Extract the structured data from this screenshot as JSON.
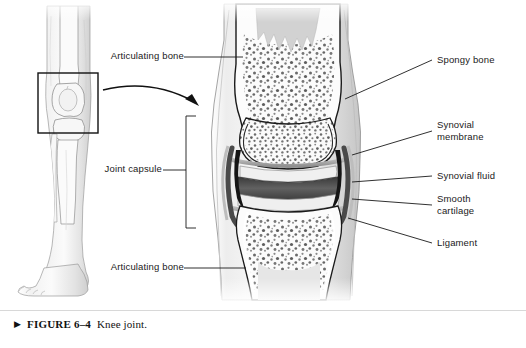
{
  "figure": {
    "caption_marker": "▶",
    "number": "FIGURE 6–4",
    "title": "Knee joint."
  },
  "labels": {
    "left": [
      {
        "id": "articulating-bone-top",
        "text": "Articulating bone"
      },
      {
        "id": "joint-capsule",
        "text": "Joint capsule"
      },
      {
        "id": "articulating-bone-bottom",
        "text": "Articulating bone"
      }
    ],
    "right": [
      {
        "id": "spongy-bone",
        "text": "Spongy bone"
      },
      {
        "id": "synovial-membrane",
        "text": "Synovial\nmembrane"
      },
      {
        "id": "synovial-fluid",
        "text": "Synovial fluid"
      },
      {
        "id": "smooth-cartilage",
        "text": "Smooth\ncartilage"
      },
      {
        "id": "ligament",
        "text": "Ligament"
      }
    ]
  },
  "illustrations": {
    "leg_inset": {
      "alt": "anterior view of lower leg with knee"
    },
    "knee_section": {
      "alt": "magnified frontal section of knee joint"
    },
    "arrow": {
      "alt": "curved magnification arrow"
    }
  },
  "colors": {
    "line": "#1a1a1a",
    "rule": "#d8d8d8",
    "bone_fill": "#f4f4f4",
    "spongy_speckle": "#6f6f6f",
    "cartilage": "#e9e9e9",
    "cavity_dark": "#4a4a4a",
    "skin_shade": "#d9d9d9",
    "text": "#1a1a1a"
  }
}
